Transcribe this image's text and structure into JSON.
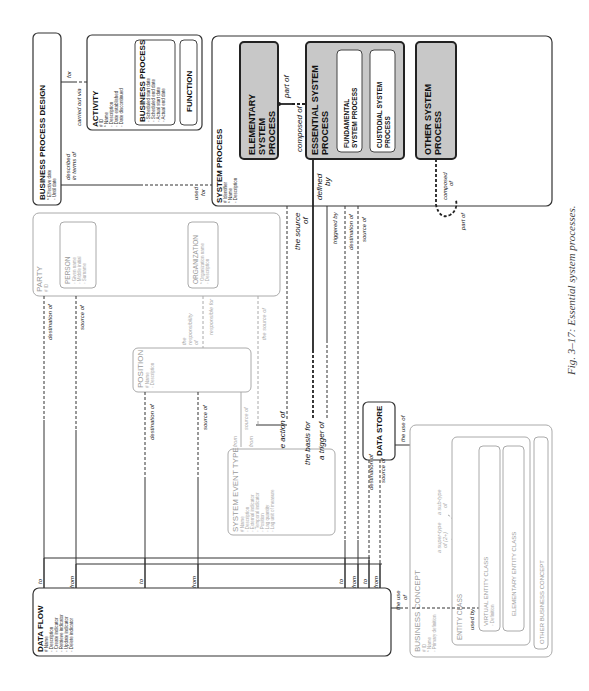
{
  "figure": {
    "caption": "Fig. 3–17: Essential system processes."
  },
  "entities": {
    "business_process_design": {
      "title": "BUSINESS PROCESS DESIGN",
      "attrs": [
        "* Effective date",
        "◦ Until date"
      ]
    },
    "activity": {
      "title": "ACTIVITY",
      "attrs": [
        "# ID",
        "* Name",
        "◦ Description",
        "◦ Date established",
        "◦ Date discontinued"
      ]
    },
    "business_process": {
      "title": "BUSINESS PROCESS",
      "attrs": [
        "◦ Scheduled start date",
        "◦ Scheduled end date",
        "◦ Actual start date",
        "◦ Actual end date"
      ]
    },
    "function": {
      "title": "FUNCTION"
    },
    "system_process": {
      "title": "SYSTEM PROCESS",
      "attrs": [
        "# Identifier",
        "* Name",
        "◦ Description"
      ]
    },
    "elementary_system_process": {
      "title_lines": [
        "ELEMENTARY",
        "SYSTEM",
        "PROCESS"
      ]
    },
    "essential_system_process": {
      "title_lines": [
        "ESSENTIAL SYSTEM",
        "PROCESS"
      ]
    },
    "fundamental_system_process": {
      "title_lines": [
        "FUNDAMENTAL",
        "SYSTEM PROCESS"
      ]
    },
    "custodial_system_process": {
      "title_lines": [
        "CUSTODIAL SYSTEM",
        "PROCESS"
      ]
    },
    "other_system_process": {
      "title_lines": [
        "OTHER SYSTEM",
        "PROCESS"
      ]
    },
    "party": {
      "title": "PARTY",
      "attrs": [
        "# ID"
      ]
    },
    "person": {
      "title": "PERSON",
      "attrs": [
        "◦ Given name",
        "◦ Middle initial",
        "◦ Surname"
      ]
    },
    "organization": {
      "title": "ORGANIZATION",
      "attrs": [
        "* Organization name",
        "◦ Description"
      ]
    },
    "position": {
      "title": "POSITION",
      "attrs": [
        "# Name",
        "◦ Description"
      ]
    },
    "system_event_type": {
      "title": "SYSTEM EVENT TYPE",
      "attrs": [
        "# Name",
        "◦ Description",
        "◦ External indicator",
        "◦ Temporal indicator",
        "◦ Position",
        "◦ Lag quantity",
        "◦ Lag unit of measure"
      ]
    },
    "data_store": {
      "title": "DATA STORE"
    },
    "data_flow": {
      "title": "DATA FLOW",
      "attrs": [
        "# Name",
        "◦ Description",
        "◦ Create indicator",
        "◦ Retrieve indicator",
        "◦ Update indicator",
        "◦ Delete indicator"
      ]
    },
    "business_concept": {
      "title": "BUSINESS CONCEPT",
      "attrs": [
        "# ID",
        "* Name",
        "◦ Primary definition"
      ]
    },
    "entity_class": {
      "title": "ENTITY CLASS"
    },
    "virtual_entity_class": {
      "title": "VIRTUAL ENTITY CLASS",
      "attrs": [
        "◦ Definition"
      ]
    },
    "elementary_entity_class": {
      "title": "ELEMENTARY ENTITY CLASS"
    },
    "other_business_concept": {
      "title": "OTHER BUSINESS CONCEPT"
    }
  },
  "relationships": {
    "for": "for",
    "carried_out_via": "carried out via",
    "described_in_terms_of": [
      "described",
      "in terms of"
    ],
    "used_for": [
      "used",
      "for"
    ],
    "part_of": "part of",
    "composed_of": "composed of",
    "defined_by": [
      "defined",
      "by"
    ],
    "composed_of_2": [
      "composed",
      "of"
    ],
    "part_of_2": "part of",
    "the_source_of": [
      "the source",
      "of"
    ],
    "triggered_by": "triggered by",
    "destination_of": "destination of",
    "source_of": "source of",
    "the_responsibility_of": [
      "the",
      "responsibility",
      "of"
    ],
    "responsible_for": "responsible for",
    "the_source_of_grey": "the source of",
    "from": "from",
    "to": "to",
    "the_action_of": "the action of",
    "the_basis_for": "the basis for",
    "a_trigger_of": "a trigger of",
    "the_use_of": "the use of",
    "the_use_of_2": [
      "the use",
      "of"
    ],
    "expressed_as": "expressed as",
    "a_sub_type_of": [
      "a sub-type",
      "of"
    ],
    "a_super_type_of": [
      "a super-type",
      "of (2+)"
    ],
    "used_by": "used by"
  }
}
